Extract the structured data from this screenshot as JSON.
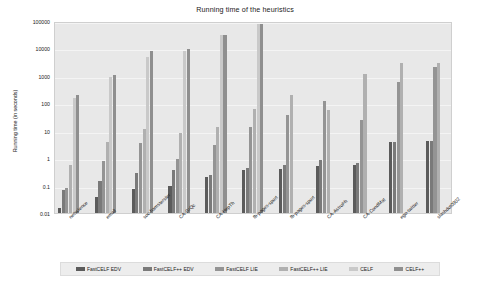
{
  "chart_data": {
    "type": "bar",
    "title": "Running time of the heuristics",
    "xlabel": "",
    "ylabel": "Running time (in seconds)",
    "yscale": "log",
    "ylim": [
      0.01,
      100000
    ],
    "yticks": [
      0.01,
      0.1,
      1,
      10,
      100,
      1000,
      10000,
      100000
    ],
    "ytick_labels": [
      "0.01",
      "0.1",
      "1",
      "10",
      "100",
      "1000",
      "10000",
      "100000"
    ],
    "grid": true,
    "legend_position": "bottom",
    "categories": [
      "netscience",
      "email",
      "soc-hamsterster",
      "CA-GrQc",
      "CA-HepTh",
      "fb-pages-sport",
      "fb-pages-sport",
      "CA-AstroPh",
      "CA-CondMat",
      "ego-twitter",
      "slashdot0902"
    ],
    "series": [
      {
        "name": "FastCELF EDV",
        "color": "#5b5b5b",
        "values": [
          0.015,
          0.037,
          0.075,
          0.1,
          0.21,
          0.36,
          0.39,
          0.52,
          0.54,
          3.8,
          4.1
        ]
      },
      {
        "name": "FastCELF++ EDV",
        "color": "#7a7a7a",
        "values": [
          0.07,
          0.15,
          0.3,
          0.36,
          0.24,
          0.42,
          0.56,
          0.85,
          0.65,
          4.0,
          4.3
        ]
      },
      {
        "name": "FastCELF LIE",
        "color": "#949494",
        "values": [
          0.08,
          0.8,
          3.6,
          0.9,
          2.9,
          14,
          36,
          120,
          25,
          600,
          2100
        ]
      },
      {
        "name": "FastCELF++ LIE",
        "color": "#b0b0b0",
        "values": [
          0.55,
          3.9,
          12,
          8.5,
          14,
          60,
          200,
          55,
          1200,
          3000,
          3000
        ]
      },
      {
        "name": "CELF",
        "color": "#c9c9c9",
        "values": [
          150,
          900,
          5000,
          7800,
          30000,
          75000,
          null,
          null,
          null,
          null,
          null
        ]
      },
      {
        "name": "CELF++",
        "color": "#8f8f8f",
        "values": [
          195,
          1050,
          7800,
          9200,
          32000,
          78000,
          null,
          null,
          null,
          null,
          null
        ]
      }
    ]
  },
  "legend": {
    "items": [
      {
        "label": "FastCELF EDV",
        "color": "#5b5b5b"
      },
      {
        "label": "FastCELF++ EDV",
        "color": "#7a7a7a"
      },
      {
        "label": "FastCELF LIE",
        "color": "#949494"
      },
      {
        "label": "FastCELF++ LIE",
        "color": "#b0b0b0"
      },
      {
        "label": "CELF",
        "color": "#c9c9c9"
      },
      {
        "label": "CELF++",
        "color": "#8f8f8f"
      }
    ]
  }
}
